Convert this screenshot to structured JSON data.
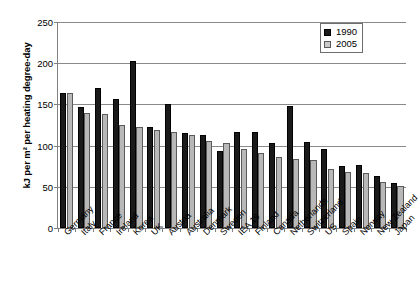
{
  "chart_data": {
    "type": "bar",
    "title": "",
    "xlabel": "",
    "ylabel": "kJ per m² per heating degree-day",
    "ylim": [
      0,
      250
    ],
    "yticks": [
      0,
      50,
      100,
      150,
      200,
      250
    ],
    "grid": true,
    "legend_position": "top-right",
    "categories": [
      "Germany",
      "Italy",
      "France",
      "Ireland",
      "Korea",
      "UK",
      "Austria",
      "Australia",
      "Denmark",
      "Sweden",
      "IEA 19",
      "Finland",
      "Canada",
      "Netherlands",
      "Switzerland",
      "US",
      "Spain",
      "Norway",
      "New Zealand",
      "Japan"
    ],
    "series": [
      {
        "name": "1990",
        "color": "#1a1a1a",
        "values": [
          164,
          147,
          170,
          157,
          203,
          123,
          150,
          115,
          113,
          94,
          116,
          117,
          103,
          148,
          104,
          96,
          75,
          76,
          63,
          55
        ]
      },
      {
        "name": "2005",
        "color": "#b8b8b8",
        "values": [
          164,
          140,
          138,
          125,
          122,
          119,
          117,
          113,
          105,
          103,
          96,
          91,
          86,
          84,
          83,
          72,
          68,
          67,
          56,
          51
        ]
      }
    ]
  },
  "legend": {
    "items": [
      {
        "label": "1990",
        "swatch": "black-square-icon"
      },
      {
        "label": "2005",
        "swatch": "gray-square-icon"
      }
    ]
  },
  "axes": {
    "y_title": "kJ per m² per heating degree-day",
    "y_tick_labels": [
      "250",
      "200",
      "150",
      "100",
      "50",
      "0"
    ]
  }
}
